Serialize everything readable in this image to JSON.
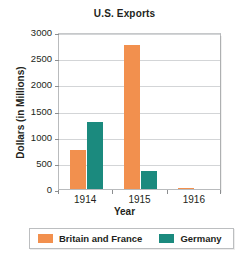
{
  "chart_data": {
    "type": "bar",
    "title": "U.S. Exports",
    "xlabel": "Year",
    "ylabel": "Dollars (in Millions)",
    "categories": [
      "1914",
      "1915",
      "1916"
    ],
    "series": [
      {
        "name": "Britain and France",
        "color": "#f2904e",
        "values": [
          750,
          2750,
          25
        ]
      },
      {
        "name": "Germany",
        "color": "#1b8a7e",
        "values": [
          1275,
          350,
          0
        ]
      }
    ],
    "ylim": [
      0,
      3000
    ],
    "yticks": [
      0,
      500,
      1000,
      1500,
      2000,
      2500,
      3000
    ],
    "ytick_labels": [
      "0",
      "500",
      "1000",
      "1500",
      "2000",
      "2500",
      "3000"
    ],
    "grid": "horizontal",
    "legend_position": "bottom"
  },
  "legend": {
    "entries": [
      {
        "label": "Britain and France",
        "color": "#f2904e"
      },
      {
        "label": "Germany",
        "color": "#1b8a7e"
      }
    ]
  }
}
